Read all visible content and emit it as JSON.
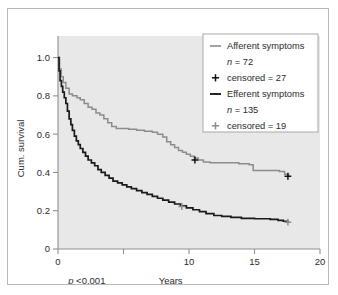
{
  "chart_data": {
    "type": "line",
    "subtype": "kaplan-meier-survival",
    "title": "",
    "xlabel": "Years",
    "ylabel": "Cum. survival",
    "xlim": [
      0,
      20
    ],
    "ylim": [
      0,
      1.05
    ],
    "xticks": [
      0,
      5,
      10,
      15,
      20
    ],
    "xticklabels": [
      "0",
      "",
      "10",
      "15",
      "20"
    ],
    "yticks": [
      0,
      0.2,
      0.4,
      0.6,
      0.8,
      1.0
    ],
    "yticklabels": [
      "0",
      "0.2",
      "0.4",
      "0.6",
      "0.8",
      "1.0"
    ],
    "grid": false,
    "plot_background": "#e8e8e8",
    "annotations": [
      {
        "name": "p-value",
        "text_italic": "p",
        "text": " <0.001",
        "x": 2.2,
        "y": -0.14
      }
    ],
    "legend": {
      "position": "top-right",
      "entries": [
        {
          "marker": "line",
          "color": "#8c8c8c",
          "label": "Afferent symptoms",
          "n_prefix": "n",
          "n_value": " = 72",
          "censored_marker": "+",
          "censored_color": "#111111",
          "censored_label": "censored = 27"
        },
        {
          "marker": "line",
          "color": "#1a1a1a",
          "label": "Efferent symptoms",
          "n_prefix": "n",
          "n_value": " = 135",
          "censored_marker": "+",
          "censored_color": "#8c8c8c",
          "censored_label": "censored = 19"
        }
      ]
    },
    "series": [
      {
        "name": "Afferent symptoms",
        "color": "#8c8c8c",
        "n": 72,
        "censored": 27,
        "points": [
          [
            0.0,
            1.0
          ],
          [
            0.12,
            0.94
          ],
          [
            0.25,
            0.9
          ],
          [
            0.4,
            0.87
          ],
          [
            0.6,
            0.84
          ],
          [
            0.85,
            0.81
          ],
          [
            1.1,
            0.8
          ],
          [
            1.45,
            0.79
          ],
          [
            1.7,
            0.78
          ],
          [
            2.0,
            0.76
          ],
          [
            2.3,
            0.74
          ],
          [
            2.6,
            0.73
          ],
          [
            2.9,
            0.71
          ],
          [
            3.2,
            0.7
          ],
          [
            3.5,
            0.68
          ],
          [
            3.8,
            0.66
          ],
          [
            4.1,
            0.64
          ],
          [
            4.45,
            0.63
          ],
          [
            5.4,
            0.625
          ],
          [
            6.0,
            0.62
          ],
          [
            6.6,
            0.615
          ],
          [
            7.2,
            0.61
          ],
          [
            7.6,
            0.6
          ],
          [
            8.0,
            0.585
          ],
          [
            8.3,
            0.56
          ],
          [
            8.6,
            0.545
          ],
          [
            8.9,
            0.53
          ],
          [
            9.2,
            0.515
          ],
          [
            9.5,
            0.505
          ],
          [
            9.8,
            0.495
          ],
          [
            10.1,
            0.485
          ],
          [
            10.4,
            0.475
          ],
          [
            10.7,
            0.465
          ],
          [
            11.1,
            0.455
          ],
          [
            11.6,
            0.45
          ],
          [
            13.4,
            0.45
          ],
          [
            13.8,
            0.445
          ],
          [
            14.6,
            0.44
          ],
          [
            14.9,
            0.41
          ],
          [
            16.9,
            0.405
          ],
          [
            17.3,
            0.39
          ],
          [
            17.6,
            0.38
          ]
        ],
        "censor_marks": [
          [
            10.45,
            0.465
          ],
          [
            17.55,
            0.38
          ]
        ]
      },
      {
        "name": "Efferent symptoms",
        "color": "#1a1a1a",
        "n": 135,
        "censored": 19,
        "points": [
          [
            0.0,
            1.0
          ],
          [
            0.08,
            0.93
          ],
          [
            0.16,
            0.88
          ],
          [
            0.26,
            0.85
          ],
          [
            0.36,
            0.82
          ],
          [
            0.48,
            0.79
          ],
          [
            0.6,
            0.76
          ],
          [
            0.72,
            0.72
          ],
          [
            0.85,
            0.68
          ],
          [
            0.98,
            0.65
          ],
          [
            1.1,
            0.62
          ],
          [
            1.25,
            0.59
          ],
          [
            1.4,
            0.565
          ],
          [
            1.55,
            0.545
          ],
          [
            1.7,
            0.525
          ],
          [
            1.9,
            0.505
          ],
          [
            2.1,
            0.485
          ],
          [
            2.3,
            0.465
          ],
          [
            2.55,
            0.45
          ],
          [
            2.8,
            0.435
          ],
          [
            3.05,
            0.415
          ],
          [
            3.3,
            0.4
          ],
          [
            3.6,
            0.385
          ],
          [
            3.9,
            0.37
          ],
          [
            4.2,
            0.355
          ],
          [
            4.55,
            0.345
          ],
          [
            4.9,
            0.335
          ],
          [
            5.25,
            0.325
          ],
          [
            5.6,
            0.315
          ],
          [
            6.0,
            0.305
          ],
          [
            6.4,
            0.295
          ],
          [
            6.8,
            0.285
          ],
          [
            7.2,
            0.275
          ],
          [
            7.6,
            0.265
          ],
          [
            8.0,
            0.255
          ],
          [
            8.45,
            0.245
          ],
          [
            8.9,
            0.235
          ],
          [
            9.35,
            0.225
          ],
          [
            9.8,
            0.215
          ],
          [
            10.3,
            0.205
          ],
          [
            10.8,
            0.195
          ],
          [
            11.3,
            0.185
          ],
          [
            11.9,
            0.175
          ],
          [
            12.5,
            0.17
          ],
          [
            13.2,
            0.165
          ],
          [
            14.0,
            0.16
          ],
          [
            15.0,
            0.158
          ],
          [
            16.2,
            0.155
          ],
          [
            16.8,
            0.15
          ],
          [
            17.2,
            0.145
          ],
          [
            17.55,
            0.14
          ]
        ],
        "censor_marks": [
          [
            9.45,
            0.222
          ],
          [
            17.55,
            0.14
          ]
        ]
      }
    ]
  }
}
